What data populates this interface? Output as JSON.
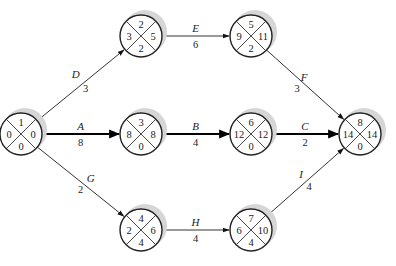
{
  "diagram": {
    "type": "activity-on-arrow network",
    "nodes": [
      {
        "id": "n1",
        "top": "1",
        "left": "0",
        "right": "0",
        "bottom": "0"
      },
      {
        "id": "n2",
        "top": "2",
        "left": "3",
        "right": "5",
        "bottom": "2"
      },
      {
        "id": "n3",
        "top": "5",
        "left": "9",
        "right": "11",
        "bottom": "2"
      },
      {
        "id": "n4",
        "top": "3",
        "left": "8",
        "right": "8",
        "bottom": "0"
      },
      {
        "id": "n5",
        "top": "6",
        "left": "12",
        "right": "12",
        "bottom": "0"
      },
      {
        "id": "n6",
        "top": "8",
        "left": "14",
        "right": "14",
        "bottom": "0"
      },
      {
        "id": "n7",
        "top": "4",
        "left": "2",
        "right": "6",
        "bottom": "4"
      },
      {
        "id": "n8",
        "top": "7",
        "left": "6",
        "right": "10",
        "bottom": "4"
      }
    ],
    "activities": [
      {
        "name": "D",
        "duration": "3",
        "from": "n1",
        "to": "n2",
        "critical": false
      },
      {
        "name": "E",
        "duration": "6",
        "from": "n2",
        "to": "n3",
        "critical": false
      },
      {
        "name": "F",
        "duration": "3",
        "from": "n3",
        "to": "n6",
        "critical": false
      },
      {
        "name": "A",
        "duration": "8",
        "from": "n1",
        "to": "n4",
        "critical": true
      },
      {
        "name": "B",
        "duration": "4",
        "from": "n4",
        "to": "n5",
        "critical": true
      },
      {
        "name": "C",
        "duration": "2",
        "from": "n5",
        "to": "n6",
        "critical": true
      },
      {
        "name": "G",
        "duration": "2",
        "from": "n1",
        "to": "n7",
        "critical": false
      },
      {
        "name": "H",
        "duration": "4",
        "from": "n7",
        "to": "n8",
        "critical": false
      },
      {
        "name": "I",
        "duration": "4",
        "from": "n8",
        "to": "n6",
        "critical": false
      }
    ]
  }
}
